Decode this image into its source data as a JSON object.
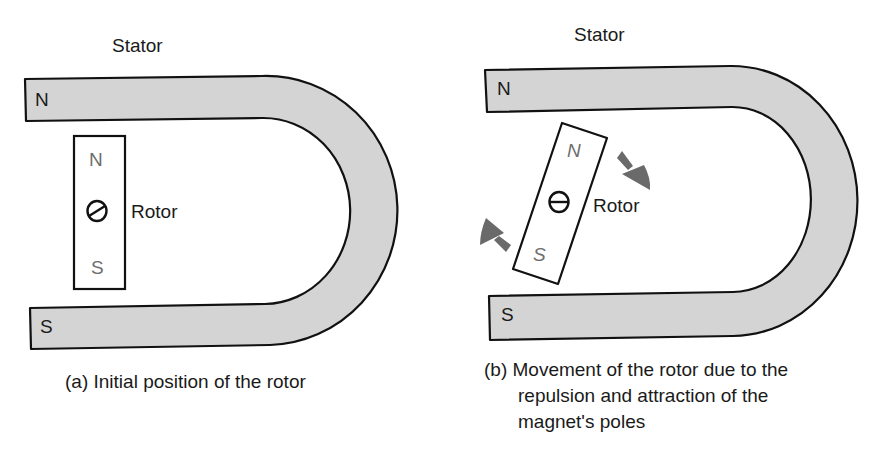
{
  "colors": {
    "stator_fill": "#d4d4d4",
    "outline": "#111111",
    "rotor_fill": "#ffffff",
    "arrow": "#6a6a6a",
    "rotor_pole_text": "#6e6e6e"
  },
  "panel_a": {
    "stator_label": "Stator",
    "stator_north": "N",
    "stator_south": "S",
    "rotor_north": "N",
    "rotor_south": "S",
    "rotor_label": "Rotor",
    "caption": "(a) Initial position of the rotor"
  },
  "panel_b": {
    "stator_label": "Stator",
    "stator_north": "N",
    "stator_south": "S",
    "rotor_north": "N",
    "rotor_south": "S",
    "rotor_label": "Rotor",
    "caption_line1": "(b) Movement of the rotor due to the",
    "caption_line2": "repulsion and attraction of the",
    "caption_line3": "magnet's poles",
    "arrows": [
      "clockwise-arrow-top",
      "clockwise-arrow-bottom"
    ]
  }
}
